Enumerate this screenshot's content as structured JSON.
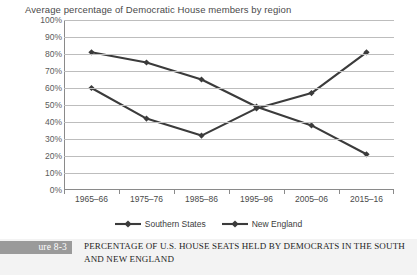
{
  "chart_data": {
    "type": "line",
    "title": "Average percentage of Democratic House members by region",
    "xlabel": "",
    "ylabel": "",
    "ylim": [
      0,
      100
    ],
    "ytick_suffix": "%",
    "yticks": [
      0,
      10,
      20,
      30,
      40,
      50,
      60,
      70,
      80,
      90,
      100
    ],
    "ytick_labels": [
      "0%",
      "10%",
      "20%",
      "30%",
      "40%",
      "50%",
      "60%",
      "70%",
      "80%",
      "90%",
      "100%"
    ],
    "categories": [
      "1965–66",
      "1975–76",
      "1985–86",
      "1995–96",
      "2005–06",
      "2015–16"
    ],
    "series": [
      {
        "name": "Southern States",
        "values": [
          81,
          75,
          65,
          49,
          38,
          21
        ],
        "color": "#3b3b3b",
        "marker": "diamond"
      },
      {
        "name": "New England",
        "values": [
          60,
          42,
          32,
          48,
          57,
          81
        ],
        "color": "#3b3b3b",
        "marker": "diamond"
      }
    ],
    "grid": "horizontal",
    "legend_position": "bottom"
  },
  "figure": {
    "tag": "ure 8-3",
    "caption": "PERCENTAGE OF U.S. HOUSE SEATS HELD BY DEMOCRATS IN THE SOUTH AND NEW ENGLAND"
  }
}
